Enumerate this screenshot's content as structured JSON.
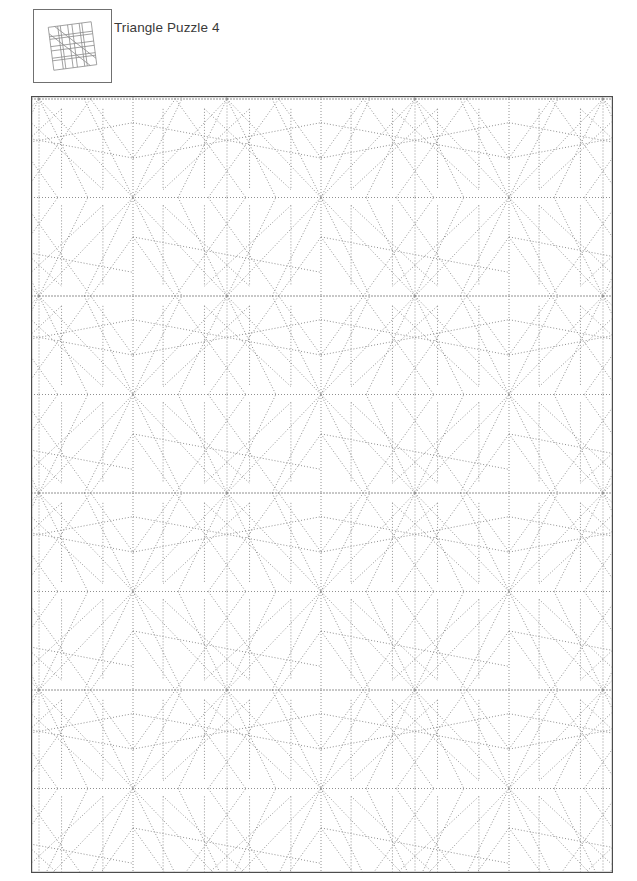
{
  "page": {
    "title": "Triangle Puzzle 4",
    "background_color": "#ffffff",
    "text_color": "#3a3a3a"
  },
  "thumbnail": {
    "name": "triangle-puzzle-preview",
    "border_color": "#707070",
    "line_color": "#808080",
    "width": 79,
    "height": 74,
    "description": "tilted square subdivided by straight chords"
  },
  "puzzle": {
    "frame": {
      "x": 31,
      "y": 96,
      "width": 582,
      "height": 777,
      "border_color": "#4d4d4d",
      "border_width": 1.2
    },
    "line_color": "#909090",
    "line_width": 1,
    "dash": "1 2",
    "style": "dotted",
    "tiling": {
      "cell_width": 188,
      "cell_height": 197,
      "origin_x": 227,
      "origin_y": 99,
      "rays_per_hub": 10,
      "columns": 5,
      "rows": 6
    }
  },
  "chart_data": {
    "type": "diagram",
    "title": "Triangle Puzzle 4",
    "unit_cell": {
      "width": 188,
      "height": 197,
      "hub_offsets": [
        [
          0,
          0
        ],
        [
          94,
          98.5
        ]
      ],
      "notes": "Two-hub (centered-rectangular) lattice; each hub emits straight chords that meet neighbouring hubs and rotated-square edges."
    },
    "vertices": [
      {
        "id": "hub",
        "role": "star-center",
        "valence": 10
      },
      {
        "id": "mid",
        "role": "edge-junction",
        "valence": 4
      }
    ],
    "edges_per_cell": 22,
    "visible_hub_rows": 6,
    "visible_hub_cols": 5
  }
}
